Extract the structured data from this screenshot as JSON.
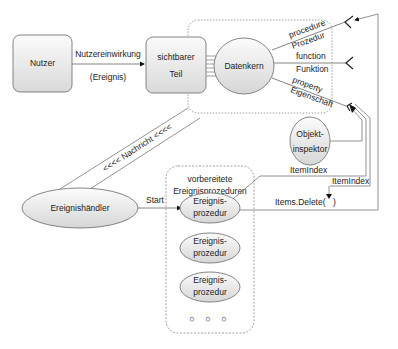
{
  "nodes": {
    "nutzer": "Nutzer",
    "sichtbarer_teil": [
      "sichtbarer",
      "Teil"
    ],
    "datenkern": "Datenkern",
    "objektinspektor": [
      "Objekt-",
      "inspektor"
    ],
    "ereignishaendler": "Ereignishändler",
    "group_title": [
      "vorbereitete",
      "Ereignisprozeduren"
    ],
    "ereignisprozedur_1": [
      "Ereignis-",
      "prozedur"
    ],
    "ereignisprozedur_2": [
      "Ereignis-",
      "prozedur"
    ],
    "ereignisprozedur_3": [
      "Ereignis-",
      "prozedur"
    ],
    "ellipsis": "○ ○ ○"
  },
  "edges": {
    "nutzereinwirkung": "Nutzereinwirkung",
    "ereignis": "(Ereignis)",
    "procedure": "procedure",
    "prozedur": "Prozedur",
    "function": "function",
    "funktion": "Funktion",
    "property": "property",
    "eigenschaft": "Eigenschaft",
    "nachricht": "<<<< Nachricht <<<<",
    "start": "Start",
    "itemindex_1": "ItemIndex",
    "itemindex_2": "ItemIndex",
    "items_delete": "Items.Delete(",
    "items_delete_close": ")"
  },
  "colors": {
    "stroke": "#777777",
    "fill_light": "#fafafa",
    "fill_dark": "#d8d8d8",
    "text": "#222222"
  }
}
